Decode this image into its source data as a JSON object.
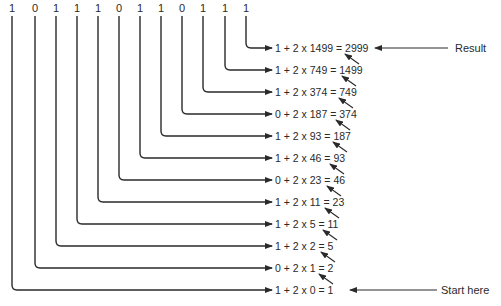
{
  "digits": [
    "1",
    "0",
    "1",
    "1",
    "1",
    "0",
    "1",
    "1",
    "0",
    "1",
    "1",
    "1"
  ],
  "rows": [
    {
      "bit": "1",
      "prev": "1499",
      "result": "2999",
      "text": "1 + 2 x 1499 = 2999"
    },
    {
      "bit": "1",
      "prev": "749",
      "result": "1499",
      "text": "1 + 2 x 749 = 1499"
    },
    {
      "bit": "1",
      "prev": "374",
      "result": "749",
      "text": "1 + 2 x 374 = 749"
    },
    {
      "bit": "0",
      "prev": "187",
      "result": "374",
      "text": "0 + 2 x 187 = 374"
    },
    {
      "bit": "1",
      "prev": "93",
      "result": "187",
      "text": "1 + 2 x 93 = 187"
    },
    {
      "bit": "1",
      "prev": "46",
      "result": "93",
      "text": "1 + 2 x 46 = 93"
    },
    {
      "bit": "0",
      "prev": "23",
      "result": "46",
      "text": "0 + 2 x 23 = 46"
    },
    {
      "bit": "1",
      "prev": "11",
      "result": "23",
      "text": "1 + 2 x 11 = 23"
    },
    {
      "bit": "1",
      "prev": "5",
      "result": "11",
      "text": "1 + 2 x 5 = 11"
    },
    {
      "bit": "1",
      "prev": "2",
      "result": "5",
      "text": "1 + 2 x 2 = 5"
    },
    {
      "bit": "0",
      "prev": "1",
      "result": "2",
      "text": "0 + 2 x 1 = 2"
    },
    {
      "bit": "1",
      "prev": "0",
      "result": "1",
      "text": "1 + 2 x 0 = 1"
    }
  ],
  "labels": {
    "result": "Result",
    "start": "Start here"
  },
  "colors": {
    "stroke": "#2a2a2a",
    "background": "#ffffff"
  }
}
